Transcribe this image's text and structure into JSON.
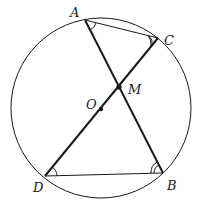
{
  "diagram": {
    "type": "geometry-circle",
    "colors": {
      "stroke": "#1a1a1a",
      "background": "#ffffff"
    },
    "circle": {
      "center_label": "O",
      "cx": 101,
      "cy": 108,
      "r": 90
    },
    "points": {
      "A": {
        "label": "A",
        "x": 85,
        "y": 20
      },
      "C": {
        "label": "C",
        "x": 158,
        "y": 38
      },
      "M": {
        "label": "M",
        "x": 119,
        "y": 87
      },
      "O": {
        "label": "O",
        "x": 101,
        "y": 109
      },
      "D": {
        "label": "D",
        "x": 45,
        "y": 176
      },
      "B": {
        "label": "B",
        "x": 163,
        "y": 173
      }
    },
    "segments": [
      "AB",
      "CD",
      "AC",
      "DB"
    ],
    "angle_marks": [
      {
        "vertex": "A",
        "arcs": 1
      },
      {
        "vertex": "C",
        "arcs": 2
      },
      {
        "vertex": "D",
        "arcs": 1
      },
      {
        "vertex": "B",
        "arcs": 2
      }
    ]
  }
}
